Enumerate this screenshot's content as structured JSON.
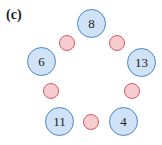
{
  "figure": {
    "label": "(c)",
    "colors": {
      "number_fill": "#cfe2f6",
      "number_border": "#4a86d0",
      "slot_fill": "#f7cdd0",
      "slot_border": "#d9545e"
    },
    "number_circles": [
      {
        "value": "8",
        "x": 92,
        "y": 24
      },
      {
        "value": "13",
        "x": 142,
        "y": 63
      },
      {
        "value": "4",
        "x": 124,
        "y": 122
      },
      {
        "value": "11",
        "x": 60,
        "y": 122
      },
      {
        "value": "6",
        "x": 42,
        "y": 62
      }
    ],
    "slot_circles": [
      {
        "x": 117,
        "y": 43
      },
      {
        "x": 132,
        "y": 91
      },
      {
        "x": 91,
        "y": 122
      },
      {
        "x": 51,
        "y": 91
      },
      {
        "x": 67,
        "y": 43
      }
    ]
  }
}
